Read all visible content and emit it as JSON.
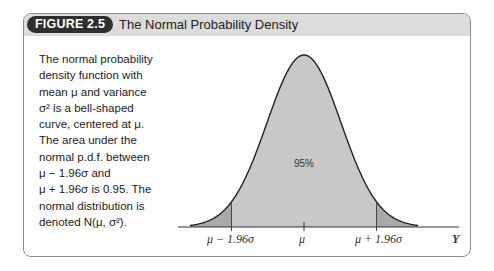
{
  "figure": {
    "label": "FIGURE 2.5",
    "title": "The Normal Probability Density"
  },
  "description": {
    "lines": [
      "The normal probability",
      "density function with",
      "mean μ and variance",
      "σ² is a bell-shaped",
      "curve, centered at μ.",
      "The area under the",
      "normal p.d.f. between",
      "μ − 1.96σ and",
      "μ + 1.96σ is 0.95. The",
      "normal distribution is",
      "denoted N(μ, σ²)."
    ]
  },
  "chart_data": {
    "type": "area",
    "title": "The Normal Probability Density",
    "xlabel": "Y",
    "ylabel": "",
    "x_ticks": [
      "μ − 1.96σ",
      "μ",
      "μ + 1.96σ"
    ],
    "annotations": [
      {
        "text": "95%",
        "position": "center of shaded area"
      }
    ],
    "shaded_region": {
      "from": "μ − 1.96σ",
      "to": "μ + 1.96σ",
      "area": 0.95
    },
    "tails": {
      "left_area": 0.025,
      "right_area": 0.025
    },
    "grid": false,
    "legend": null
  },
  "labels": {
    "tick_left": "μ − 1.96σ",
    "tick_center": "μ",
    "tick_right": "μ + 1.96σ",
    "axis": "Y",
    "pct": "95%"
  },
  "colors": {
    "header_bg": "#dcdcdc",
    "pill_bg": "#2f2f2f",
    "center_fill": "#c8c8c8",
    "tail_fill": "#a9a9a9"
  }
}
